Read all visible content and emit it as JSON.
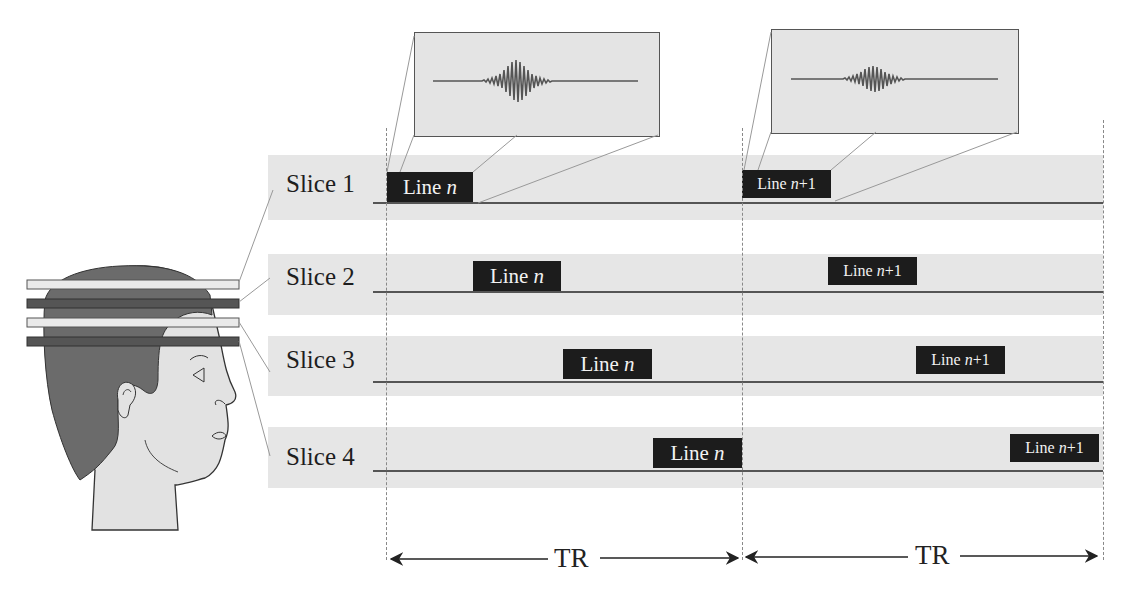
{
  "figure": {
    "colors": {
      "band": "#e6e6e6",
      "line_box": "#1c1c1c",
      "line_box_text": "#f2f2f2",
      "hair": "#6b6b6b",
      "face": "#e2e2e2",
      "slice_light": "#eaeaea",
      "slice_dark": "#555555",
      "inset_bg": "#e4e4e4"
    }
  },
  "head_illustration": {
    "slabs": [
      "light",
      "dark",
      "light",
      "dark"
    ]
  },
  "slices": [
    {
      "label": "Slice 1",
      "line_n": {
        "prefix": "Line ",
        "var": "n",
        "suffix": ""
      },
      "line_n1": {
        "prefix": "Line ",
        "var": "n",
        "suffix": "+1"
      }
    },
    {
      "label": "Slice 2",
      "line_n": {
        "prefix": "Line ",
        "var": "n",
        "suffix": ""
      },
      "line_n1": {
        "prefix": "Line ",
        "var": "n",
        "suffix": "+1"
      }
    },
    {
      "label": "Slice 3",
      "line_n": {
        "prefix": "Line ",
        "var": "n",
        "suffix": ""
      },
      "line_n1": {
        "prefix": "Line ",
        "var": "n",
        "suffix": "+1"
      }
    },
    {
      "label": "Slice 4",
      "line_n": {
        "prefix": "Line ",
        "var": "n",
        "suffix": ""
      },
      "line_n1": {
        "prefix": "Line ",
        "var": "n",
        "suffix": "+1"
      }
    }
  ],
  "insets": [
    {
      "name": "echo-signal-line-n",
      "content": "echo waveform"
    },
    {
      "name": "echo-signal-line-n1",
      "content": "echo waveform"
    }
  ],
  "timing": {
    "intervals": [
      {
        "label": "TR"
      },
      {
        "label": "TR"
      }
    ]
  }
}
